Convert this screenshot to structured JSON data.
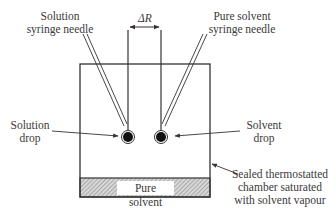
{
  "diagram": {
    "labels": {
      "solution_needle": [
        "Solution",
        "syringe needle"
      ],
      "solvent_needle": [
        "Pure solvent",
        "syringe needle"
      ],
      "delta_r": "ΔR",
      "solution_drop": [
        "Solution",
        "drop"
      ],
      "solvent_drop": [
        "Solvent",
        "drop"
      ],
      "chamber": [
        "Sealed thermostatted",
        "chamber saturated",
        "with solvent vapour"
      ],
      "reservoir": "Pure solvent"
    },
    "colors": {
      "line": "#333333",
      "drop_fill": "#111111",
      "hatch": "#9a9a9a"
    }
  }
}
